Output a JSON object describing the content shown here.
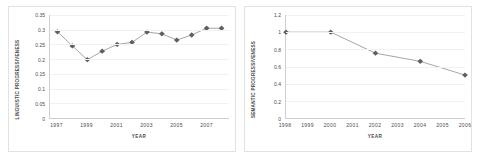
{
  "charts": [
    {
      "id": "linguistic-progressiveness",
      "ylabel": "LINGUISTIC PROGRESSIVENESS",
      "xlabel": "YEAR",
      "yticks": [
        "0",
        "0.05",
        "0.1",
        "0.15",
        "0.2",
        "0.25",
        "0.3",
        "0.35"
      ],
      "xticks": [
        "1997",
        "1999",
        "2001",
        "2003",
        "2005",
        "2007"
      ]
    },
    {
      "id": "semantic-progressiveness",
      "ylabel": "SEMANTIC PROGRESSIVENESS",
      "xlabel": "YEAR",
      "yticks": [
        "0",
        "0.2",
        "0.4",
        "0.6",
        "0.8",
        "1",
        "1.2"
      ],
      "xticks": [
        "1998",
        "1999",
        "2000",
        "2001",
        "2002",
        "2003",
        "2004",
        "2005",
        "2006"
      ]
    }
  ],
  "chart_data": [
    {
      "type": "line",
      "title": "",
      "xlabel": "YEAR",
      "ylabel": "LINGUISTIC PROGRESSIVENESS",
      "x": [
        1997,
        1998,
        1999,
        2000,
        2001,
        2002,
        2003,
        2004,
        2005,
        2006,
        2007,
        2008
      ],
      "values": [
        0.293,
        0.245,
        0.198,
        0.227,
        0.25,
        0.257,
        0.292,
        0.286,
        0.265,
        0.282,
        0.305,
        0.305
      ],
      "xlim": [
        1996.5,
        2008.5
      ],
      "ylim": [
        0,
        0.35
      ],
      "yticks": [
        0,
        0.05,
        0.1,
        0.15,
        0.2,
        0.25,
        0.3,
        0.35
      ],
      "xticks": [
        1997,
        1999,
        2001,
        2003,
        2005,
        2007
      ],
      "grid": true,
      "legend": "none",
      "marker": "diamond",
      "line_color": "#808080",
      "marker_color": "#606060"
    },
    {
      "type": "line",
      "title": "",
      "xlabel": "YEAR",
      "ylabel": "SEMANTIC PROGRESSIVENESS",
      "x": [
        1998,
        2000,
        2002,
        2004,
        2006
      ],
      "values": [
        1.0,
        1.0,
        0.755,
        0.66,
        0.5
      ],
      "xlim": [
        1998,
        2006
      ],
      "ylim": [
        0,
        1.2
      ],
      "yticks": [
        0,
        0.2,
        0.4,
        0.6,
        0.8,
        1,
        1.2
      ],
      "xticks": [
        1998,
        1999,
        2000,
        2001,
        2002,
        2003,
        2004,
        2005,
        2006
      ],
      "grid": true,
      "legend": "none",
      "marker": "diamond",
      "line_color": "#808080",
      "marker_color": "#606060"
    }
  ]
}
